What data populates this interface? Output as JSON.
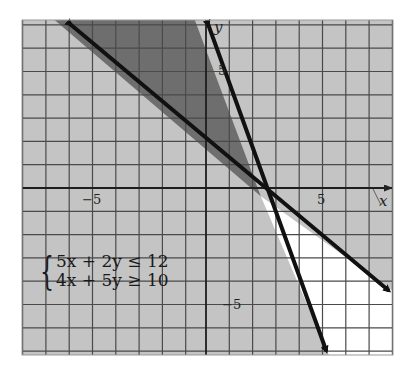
{
  "figure": {
    "type": "system-of-inequalities-graph",
    "axis_labels": {
      "x": "x",
      "y": "y"
    },
    "tick_labels": {
      "x_neg": "−5",
      "x_pos": "5",
      "y_pos": "5",
      "y_neg": "−5"
    },
    "system": {
      "inequalities": [
        "5x + 2y ≤ 12",
        "4x + 5y ≥ 10"
      ],
      "brace": "{"
    },
    "x_range": [
      -8,
      8
    ],
    "y_range": [
      -7,
      7.5
    ],
    "grid_step": 1,
    "boundary_lines": [
      {
        "equation": "5x + 2y = 12",
        "slope": -2.5,
        "intercept": 6
      },
      {
        "equation": "4x + 5y = 10",
        "slope": -0.8,
        "intercept": 2
      }
    ],
    "regions": [
      {
        "name": "solution-region",
        "description": "both inequalities satisfied (above 4x+5y=10, left of 5x+2y=12)",
        "fill": "#6e6e6e"
      },
      {
        "name": "neither-region",
        "description": "neither inequality satisfied",
        "fill": "#ffffff"
      },
      {
        "name": "single-region",
        "description": "one inequality satisfied",
        "fill": "#c4c4c4"
      }
    ],
    "colors": {
      "grid_bg": "#c4c4c4",
      "solution": "#6e6e6e",
      "grid_line": "#4a4a4a",
      "boundary": "#111111",
      "unshaded": "#ffffff"
    }
  }
}
